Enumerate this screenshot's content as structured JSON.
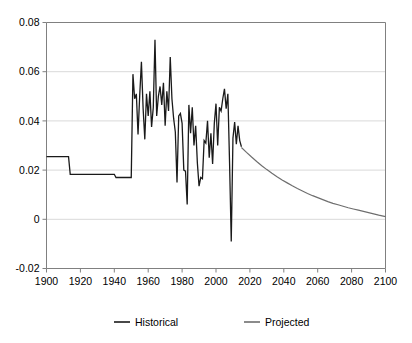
{
  "chart_data": {
    "type": "line",
    "title": "",
    "subtitle": "",
    "xlabel": "",
    "ylabel": "",
    "xlim": [
      1900,
      2100
    ],
    "ylim": [
      -0.02,
      0.08
    ],
    "grid": true,
    "grid_axis": "y",
    "legend_position": "bottom",
    "y_ticks": [
      0.08,
      0.06,
      0.04,
      0.02,
      0,
      -0.02
    ],
    "y_tick_labels": [
      "0.08",
      "0.06",
      "0.04",
      "0.02",
      "0",
      "-0.02"
    ],
    "x_ticks": [
      1900,
      1920,
      1940,
      1960,
      1980,
      2000,
      2020,
      2040,
      2060,
      2080,
      2100
    ],
    "x_tick_labels": [
      "1900",
      "1920",
      "1940",
      "1960",
      "1980",
      "2000",
      "2020",
      "2040",
      "2060",
      "2080",
      "2100"
    ],
    "series": [
      {
        "name": "Historical",
        "color": "#1a1a1a",
        "width": 1.3,
        "points": [
          [
            1900,
            0.0255
          ],
          [
            1901,
            0.0255
          ],
          [
            1902,
            0.0255
          ],
          [
            1903,
            0.0255
          ],
          [
            1904,
            0.0255
          ],
          [
            1905,
            0.0255
          ],
          [
            1906,
            0.0255
          ],
          [
            1907,
            0.0255
          ],
          [
            1908,
            0.0255
          ],
          [
            1909,
            0.0255
          ],
          [
            1910,
            0.0255
          ],
          [
            1911,
            0.0255
          ],
          [
            1912,
            0.0255
          ],
          [
            1913,
            0.0255
          ],
          [
            1914,
            0.0183
          ],
          [
            1915,
            0.0183
          ],
          [
            1916,
            0.0183
          ],
          [
            1917,
            0.0183
          ],
          [
            1918,
            0.0183
          ],
          [
            1919,
            0.0183
          ],
          [
            1920,
            0.0183
          ],
          [
            1921,
            0.0183
          ],
          [
            1922,
            0.0183
          ],
          [
            1923,
            0.0183
          ],
          [
            1924,
            0.0183
          ],
          [
            1925,
            0.0183
          ],
          [
            1926,
            0.0183
          ],
          [
            1927,
            0.0183
          ],
          [
            1928,
            0.0183
          ],
          [
            1929,
            0.0183
          ],
          [
            1930,
            0.0183
          ],
          [
            1931,
            0.0183
          ],
          [
            1932,
            0.0183
          ],
          [
            1933,
            0.0183
          ],
          [
            1934,
            0.0183
          ],
          [
            1935,
            0.0183
          ],
          [
            1936,
            0.0183
          ],
          [
            1937,
            0.0183
          ],
          [
            1938,
            0.0183
          ],
          [
            1939,
            0.0183
          ],
          [
            1940,
            0.0183
          ],
          [
            1941,
            0.017
          ],
          [
            1942,
            0.017
          ],
          [
            1943,
            0.017
          ],
          [
            1944,
            0.017
          ],
          [
            1945,
            0.017
          ],
          [
            1946,
            0.017
          ],
          [
            1947,
            0.017
          ],
          [
            1948,
            0.017
          ],
          [
            1949,
            0.017
          ],
          [
            1950,
            0.017
          ],
          [
            1951,
            0.059
          ],
          [
            1952,
            0.049
          ],
          [
            1953,
            0.051
          ],
          [
            1954,
            0.0345
          ],
          [
            1955,
            0.0505
          ],
          [
            1956,
            0.064
          ],
          [
            1957,
            0.045
          ],
          [
            1958,
            0.0325
          ],
          [
            1959,
            0.051
          ],
          [
            1960,
            0.042
          ],
          [
            1961,
            0.052
          ],
          [
            1962,
            0.0375
          ],
          [
            1963,
            0.0455
          ],
          [
            1964,
            0.073
          ],
          [
            1965,
            0.042
          ],
          [
            1966,
            0.05
          ],
          [
            1967,
            0.054
          ],
          [
            1968,
            0.0465
          ],
          [
            1969,
            0.0555
          ],
          [
            1970,
            0.038
          ],
          [
            1971,
            0.052
          ],
          [
            1972,
            0.044
          ],
          [
            1973,
            0.066
          ],
          [
            1974,
            0.049
          ],
          [
            1975,
            0.041
          ],
          [
            1976,
            0.0355
          ],
          [
            1977,
            0.015
          ],
          [
            1978,
            0.042
          ],
          [
            1979,
            0.043
          ],
          [
            1980,
            0.039
          ],
          [
            1981,
            0.02
          ],
          [
            1982,
            0.0196
          ],
          [
            1983,
            0.006
          ],
          [
            1984,
            0.0465
          ],
          [
            1985,
            0.035
          ],
          [
            1986,
            0.0455
          ],
          [
            1987,
            0.03
          ],
          [
            1988,
            0.038
          ],
          [
            1989,
            0.023
          ],
          [
            1990,
            0.0135
          ],
          [
            1991,
            0.017
          ],
          [
            1992,
            0.0165
          ],
          [
            1993,
            0.032
          ],
          [
            1994,
            0.031
          ],
          [
            1995,
            0.04
          ],
          [
            1996,
            0.025
          ],
          [
            1997,
            0.035
          ],
          [
            1998,
            0.0225
          ],
          [
            1999,
            0.039
          ],
          [
            2000,
            0.047
          ],
          [
            2001,
            0.03
          ],
          [
            2002,
            0.0455
          ],
          [
            2003,
            0.044
          ],
          [
            2004,
            0.049
          ],
          [
            2005,
            0.053
          ],
          [
            2006,
            0.045
          ],
          [
            2007,
            0.051
          ],
          [
            2008,
            0.023
          ],
          [
            2009,
            -0.009
          ],
          [
            2010,
            0.033
          ],
          [
            2011,
            0.0395
          ],
          [
            2012,
            0.0305
          ],
          [
            2013,
            0.038
          ],
          [
            2014,
            0.032
          ],
          [
            2015,
            0.0295
          ]
        ]
      },
      {
        "name": "Projected",
        "color": "#6e6e6e",
        "width": 1.2,
        "points": [
          [
            2015,
            0.0292
          ],
          [
            2018,
            0.0272
          ],
          [
            2021,
            0.0253
          ],
          [
            2024,
            0.0235
          ],
          [
            2027,
            0.0218
          ],
          [
            2030,
            0.0202
          ],
          [
            2033,
            0.0187
          ],
          [
            2036,
            0.0173
          ],
          [
            2039,
            0.016
          ],
          [
            2042,
            0.0148
          ],
          [
            2045,
            0.0136
          ],
          [
            2048,
            0.0125
          ],
          [
            2051,
            0.0115
          ],
          [
            2054,
            0.0105
          ],
          [
            2057,
            0.0096
          ],
          [
            2060,
            0.0088
          ],
          [
            2063,
            0.008
          ],
          [
            2066,
            0.0072
          ],
          [
            2069,
            0.0065
          ],
          [
            2072,
            0.0059
          ],
          [
            2075,
            0.0053
          ],
          [
            2078,
            0.0047
          ],
          [
            2081,
            0.0042
          ],
          [
            2084,
            0.0037
          ],
          [
            2087,
            0.0032
          ],
          [
            2090,
            0.0027
          ],
          [
            2093,
            0.0022
          ],
          [
            2096,
            0.0017
          ],
          [
            2100,
            0.0011
          ]
        ]
      }
    ],
    "legend": [
      {
        "label": "Historical",
        "color": "#1a1a1a"
      },
      {
        "label": "Projected",
        "color": "#6e6e6e"
      }
    ]
  },
  "colors": {
    "background": "#ffffff",
    "axis": "#808080",
    "grid": "#d9d9d9",
    "historical": "#1a1a1a",
    "projected": "#6e6e6e",
    "text": "#000000"
  }
}
